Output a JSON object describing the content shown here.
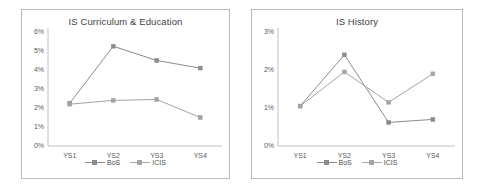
{
  "figure": {
    "background": "#ffffff",
    "panel_border_color": "#b9b9b9"
  },
  "series_style": {
    "bos_color": "#8c8c8c",
    "icis_color": "#a3a3a3",
    "bos_marker": "square",
    "icis_marker": "square"
  },
  "legend": {
    "bos_label": "BoS",
    "icis_label": "ICIS"
  },
  "chart_data": [
    {
      "type": "line",
      "title": "IS Curriculum & Education",
      "xlabel": "",
      "ylabel": "",
      "categories": [
        "YS1",
        "YS2",
        "YS3",
        "YS4"
      ],
      "ytick_labels": [
        "0%",
        "1%",
        "2%",
        "3%",
        "4%",
        "5%",
        "6%"
      ],
      "ytick_values": [
        0,
        1,
        2,
        3,
        4,
        5,
        6
      ],
      "ylim": [
        0,
        6
      ],
      "grid": false,
      "legend_position": "bottom",
      "series": [
        {
          "name": "BoS",
          "values": [
            2.25,
            5.25,
            4.5,
            4.1
          ]
        },
        {
          "name": "ICIS",
          "values": [
            2.2,
            2.4,
            2.45,
            1.5
          ]
        }
      ]
    },
    {
      "type": "line",
      "title": "IS History",
      "xlabel": "",
      "ylabel": "",
      "categories": [
        "YS1",
        "YS2",
        "YS3",
        "YS4"
      ],
      "ytick_labels": [
        "0%",
        "1%",
        "2%",
        "3%"
      ],
      "ytick_values": [
        0,
        1,
        2,
        3
      ],
      "ylim": [
        0,
        3
      ],
      "grid": false,
      "legend_position": "bottom",
      "series": [
        {
          "name": "BoS",
          "values": [
            1.05,
            2.4,
            0.62,
            0.7
          ]
        },
        {
          "name": "ICIS",
          "values": [
            1.05,
            1.95,
            1.15,
            1.9
          ]
        }
      ]
    }
  ]
}
